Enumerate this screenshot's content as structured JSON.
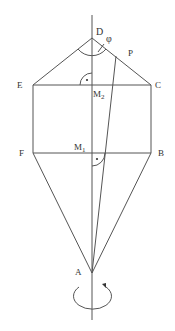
{
  "diagram": {
    "colors": {
      "stroke": "#555555",
      "text": "#333333",
      "background": "#ffffff"
    },
    "labels": {
      "D": "D",
      "phi": "φ",
      "P": "P",
      "E": "E",
      "C": "C",
      "M2": "M",
      "M2_sub": "2",
      "M1": "M",
      "M1_sub": "1",
      "F": "F",
      "B": "B",
      "A": "A"
    },
    "points": {
      "D": [
        92,
        38
      ],
      "P": [
        116,
        56
      ],
      "E": [
        33,
        85
      ],
      "C": [
        151,
        85
      ],
      "M2": [
        92,
        85
      ],
      "F": [
        33,
        153
      ],
      "B": [
        151,
        153
      ],
      "M1": [
        92,
        153
      ],
      "A": [
        92,
        273
      ]
    },
    "axis": {
      "x": 92,
      "y_top": 15,
      "y_bottom": 320
    },
    "rotation_arrow": {
      "cx": 93,
      "cy": 297,
      "rx": 19,
      "ry": 13
    },
    "right_angle_marks": [
      "M2",
      "M1"
    ],
    "angle_mark": "phi at D"
  }
}
